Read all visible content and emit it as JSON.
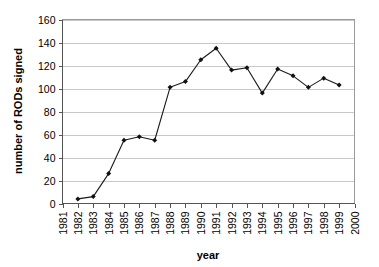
{
  "chart_data": {
    "type": "line",
    "title": "",
    "xlabel": "year",
    "ylabel": "number of RODs signed",
    "xlim": [
      1981,
      2000
    ],
    "ylim": [
      0,
      160
    ],
    "grid": "horizontal",
    "legend": "none",
    "x_ticks": [
      "1981",
      "1982",
      "1983",
      "1984",
      "1985",
      "1986",
      "1987",
      "1988",
      "1989",
      "1990",
      "1991",
      "1992",
      "1993",
      "1994",
      "1995",
      "1996",
      "1997",
      "1998",
      "1999",
      "2000"
    ],
    "y_ticks": [
      "0",
      "20",
      "40",
      "60",
      "80",
      "100",
      "120",
      "140",
      "160"
    ],
    "series": [
      {
        "name": "RODs signed",
        "marker": "diamond",
        "color": "#111111",
        "x": [
          1982,
          1983,
          1984,
          1985,
          1986,
          1987,
          1988,
          1989,
          1990,
          1991,
          1992,
          1993,
          1994,
          1995,
          1996,
          1997,
          1998,
          1999
        ],
        "values": [
          4,
          6,
          26,
          55,
          58,
          55,
          101,
          106,
          125,
          135,
          116,
          118,
          96,
          117,
          111,
          101,
          109,
          103
        ]
      }
    ]
  }
}
